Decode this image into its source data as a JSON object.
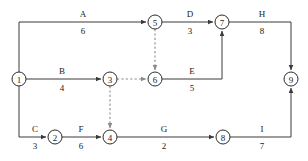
{
  "diagram": {
    "type": "activity-on-arrow-network",
    "title": "",
    "width": 308,
    "height": 161,
    "colors": {
      "background": "#ffffff",
      "edge": "#3a3a3a",
      "dummy_edge": "#8a8a8a",
      "node_stroke": "#2b2b2b",
      "text": "#1a1a1a"
    },
    "nodes": [
      {
        "id": "1",
        "label": "1",
        "x": 19,
        "y": 79,
        "r": 7
      },
      {
        "id": "2",
        "label": "2",
        "x": 55,
        "y": 137,
        "r": 7
      },
      {
        "id": "3",
        "label": "3",
        "x": 110,
        "y": 79,
        "r": 7
      },
      {
        "id": "4",
        "label": "4",
        "x": 110,
        "y": 137,
        "r": 7
      },
      {
        "id": "5",
        "label": "5",
        "x": 155,
        "y": 22,
        "r": 7
      },
      {
        "id": "6",
        "label": "6",
        "x": 155,
        "y": 79,
        "r": 7
      },
      {
        "id": "7",
        "label": "7",
        "x": 222,
        "y": 22,
        "r": 7
      },
      {
        "id": "8",
        "label": "8",
        "x": 223,
        "y": 137,
        "r": 7
      },
      {
        "id": "9",
        "label": "9",
        "x": 291,
        "y": 79,
        "r": 7
      }
    ],
    "edges": [
      {
        "id": "A",
        "name": "A",
        "duration": "6",
        "from": "1",
        "to": "5",
        "dummy": false,
        "name_x": 83,
        "name_y": 17,
        "dur_x": 83,
        "dur_y": 34
      },
      {
        "id": "B",
        "name": "B",
        "duration": "4",
        "from": "1",
        "to": "3",
        "dummy": false,
        "name_x": 62,
        "name_y": 74,
        "dur_x": 62,
        "dur_y": 91
      },
      {
        "id": "C",
        "name": "C",
        "duration": "3",
        "from": "1",
        "to": "2",
        "dummy": false,
        "name_x": 35,
        "name_y": 132,
        "dur_x": 35,
        "dur_y": 149
      },
      {
        "id": "D",
        "name": "D",
        "duration": "3",
        "from": "5",
        "to": "7",
        "dummy": false,
        "name_x": 190,
        "name_y": 17,
        "dur_x": 190,
        "dur_y": 34
      },
      {
        "id": "E",
        "name": "E",
        "duration": "5",
        "from": "6",
        "to": "7",
        "dummy": false,
        "name_x": 192,
        "name_y": 74,
        "dur_x": 192,
        "dur_y": 91
      },
      {
        "id": "F",
        "name": "F",
        "duration": "6",
        "from": "2",
        "to": "4",
        "dummy": false,
        "name_x": 81,
        "name_y": 132,
        "dur_x": 81,
        "dur_y": 149
      },
      {
        "id": "G",
        "name": "G",
        "duration": "2",
        "from": "4",
        "to": "8",
        "dummy": false,
        "name_x": 164,
        "name_y": 132,
        "dur_x": 164,
        "dur_y": 149
      },
      {
        "id": "H",
        "name": "H",
        "duration": "8",
        "from": "7",
        "to": "9",
        "dummy": false,
        "name_x": 262,
        "name_y": 17,
        "dur_x": 262,
        "dur_y": 34
      },
      {
        "id": "I",
        "name": "I",
        "duration": "7",
        "from": "8",
        "to": "9",
        "dummy": false,
        "name_x": 262,
        "name_y": 132,
        "dur_x": 262,
        "dur_y": 149
      }
    ],
    "dummy_edges": [
      {
        "id": "d56",
        "from": "5",
        "to": "6"
      },
      {
        "id": "d36",
        "from": "3",
        "to": "6"
      },
      {
        "id": "d34",
        "from": "3",
        "to": "4"
      }
    ]
  }
}
